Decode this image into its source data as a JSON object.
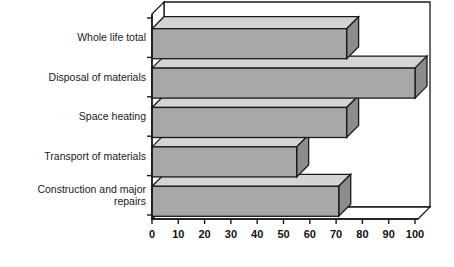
{
  "chart_data": {
    "type": "bar",
    "orientation": "horizontal",
    "style": "3d",
    "title": "",
    "subtitle": "",
    "xlabel": "",
    "ylabel": "",
    "grid": false,
    "legend": null,
    "legend_position": "none",
    "xlim": [
      0,
      100
    ],
    "xticks": [
      0,
      10,
      20,
      30,
      40,
      50,
      60,
      70,
      80,
      90,
      100
    ],
    "xtick_labels": [
      "0",
      "10",
      "20",
      "30",
      "40",
      "50",
      "60",
      "70",
      "80",
      "90",
      "100"
    ],
    "categories": [
      "Whole life total",
      "Disposal of materials",
      "Space heating",
      "Transport of materials",
      "Construction and major repairs"
    ],
    "values": [
      74,
      100,
      74,
      55,
      71
    ],
    "annotations": []
  },
  "colors": {
    "bar_front": "#a8a8a8",
    "bar_top": "#d4d4d4",
    "bar_side": "#8c8c8c",
    "outline": "#1a1a1a",
    "background": "#ffffff",
    "axis": "#1a1a1a",
    "text": "#1a1a1a"
  },
  "axis": {
    "x_tick_font_weight": "bold",
    "category_label_align": "right"
  }
}
